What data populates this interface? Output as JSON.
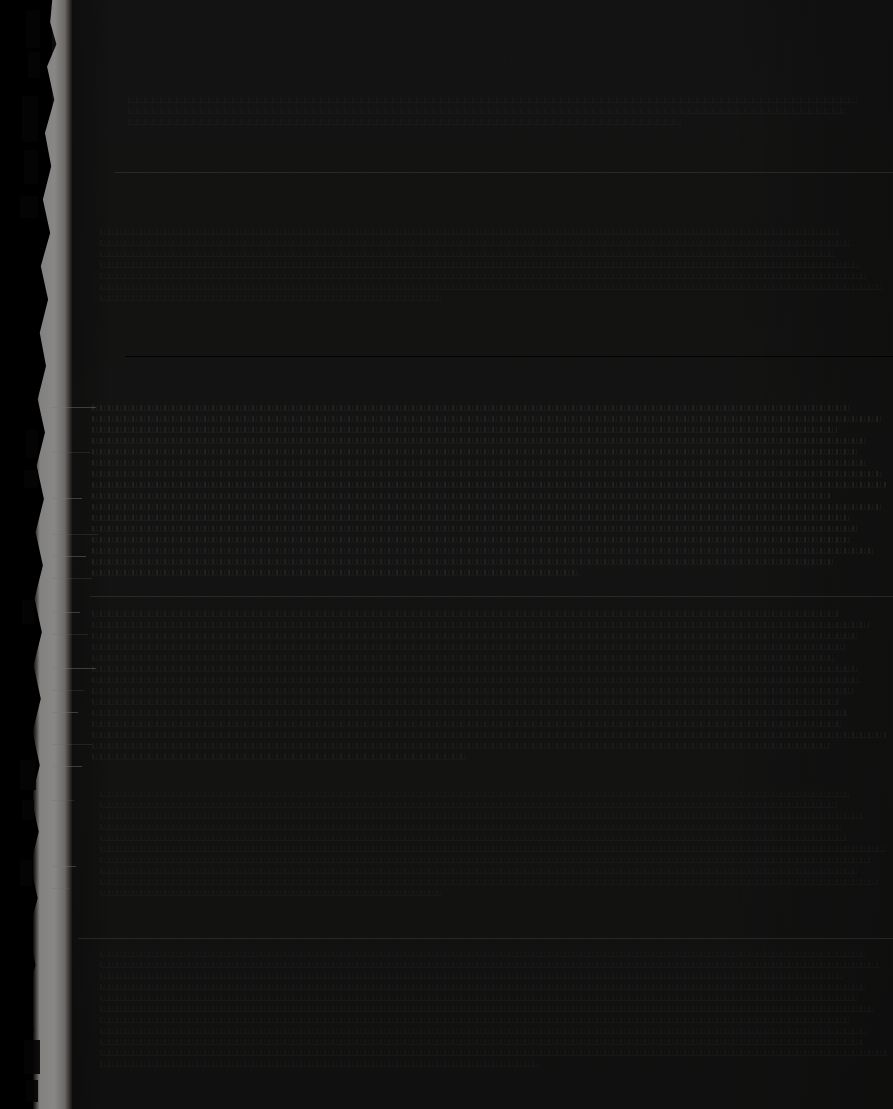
{
  "document": {
    "kind": "scanned-page",
    "title": "",
    "legible_text": "",
    "note": "Severely underexposed scan; no text is legible in the pixels.",
    "page_width": 893,
    "page_height": 1109
  },
  "colors": {
    "background": "#000000",
    "paper": "#232322",
    "torn_edge": "#fbfaf7",
    "rule_light": "#aaaaa5",
    "rule_dark": "#000000",
    "text_ink": "#605c58"
  },
  "layout": {
    "matte_left_width": 52,
    "paper_left": 52,
    "paper_width": 841,
    "text_left": 90,
    "text_right": 893
  },
  "rules": [
    {
      "name": "rule-upper",
      "top": 172,
      "left": 115,
      "width": 778,
      "weight": "light"
    },
    {
      "name": "rule-mid",
      "top": 356,
      "left": 125,
      "width": 768,
      "weight": "dark"
    },
    {
      "name": "rule-lower",
      "top": 596,
      "left": 90,
      "width": 803,
      "weight": "light"
    },
    {
      "name": "rule-bottom",
      "top": 938,
      "left": 78,
      "width": 815,
      "weight": "light"
    }
  ],
  "text_blocks": [
    {
      "name": "block-header",
      "top": 96,
      "left": 128,
      "width": 745,
      "line_count": 3,
      "density": "weak"
    },
    {
      "name": "block-upper",
      "top": 228,
      "left": 100,
      "width": 790,
      "line_count": 7,
      "density": "weak"
    },
    {
      "name": "block-main-a",
      "top": 404,
      "left": 92,
      "width": 801,
      "line_count": 16,
      "density": "strong"
    },
    {
      "name": "block-main-b",
      "top": 610,
      "left": 92,
      "width": 801,
      "line_count": 14,
      "density": "normal"
    },
    {
      "name": "block-lower",
      "top": 790,
      "left": 100,
      "width": 790,
      "line_count": 10,
      "density": "weak"
    },
    {
      "name": "block-footer",
      "top": 950,
      "left": 100,
      "width": 790,
      "line_count": 11,
      "density": "weak"
    }
  ],
  "streaks": [
    {
      "top": 407,
      "left": 52,
      "width": 44
    },
    {
      "top": 452,
      "left": 52,
      "width": 38
    },
    {
      "top": 498,
      "left": 52,
      "width": 30
    },
    {
      "top": 534,
      "left": 52,
      "width": 46
    },
    {
      "top": 556,
      "left": 52,
      "width": 34
    },
    {
      "top": 578,
      "left": 52,
      "width": 40
    },
    {
      "top": 612,
      "left": 52,
      "width": 28
    },
    {
      "top": 634,
      "left": 52,
      "width": 36
    },
    {
      "top": 668,
      "left": 52,
      "width": 44
    },
    {
      "top": 690,
      "left": 52,
      "width": 32
    },
    {
      "top": 712,
      "left": 52,
      "width": 26
    },
    {
      "top": 744,
      "left": 52,
      "width": 40
    },
    {
      "top": 766,
      "left": 52,
      "width": 30
    },
    {
      "top": 800,
      "left": 52,
      "width": 22
    },
    {
      "top": 866,
      "left": 52,
      "width": 24
    },
    {
      "top": 888,
      "left": 52,
      "width": 18
    }
  ],
  "edge_flecks": [
    {
      "top": 10,
      "left": 26,
      "w": 14,
      "h": 38
    },
    {
      "top": 52,
      "left": 28,
      "w": 12,
      "h": 26
    },
    {
      "top": 96,
      "left": 22,
      "w": 16,
      "h": 46
    },
    {
      "top": 150,
      "left": 24,
      "w": 14,
      "h": 34
    },
    {
      "top": 196,
      "left": 20,
      "w": 18,
      "h": 22
    },
    {
      "top": 430,
      "left": 26,
      "w": 12,
      "h": 28
    },
    {
      "top": 470,
      "left": 24,
      "w": 14,
      "h": 18
    },
    {
      "top": 600,
      "left": 22,
      "w": 12,
      "h": 24
    },
    {
      "top": 760,
      "left": 20,
      "w": 16,
      "h": 30
    },
    {
      "top": 800,
      "left": 22,
      "w": 12,
      "h": 20
    },
    {
      "top": 860,
      "left": 18,
      "w": 14,
      "h": 26
    },
    {
      "top": 1040,
      "left": 24,
      "w": 16,
      "h": 34
    },
    {
      "top": 1080,
      "left": 26,
      "w": 12,
      "h": 22
    }
  ]
}
